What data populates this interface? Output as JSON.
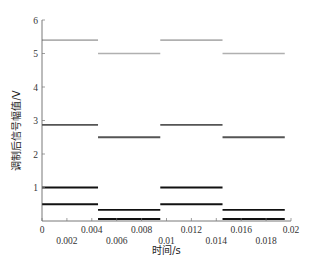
{
  "chart_data": {
    "type": "line",
    "title": "",
    "xlabel": "时间/s",
    "ylabel": "调制后信号幅值/V",
    "xlim": [
      0,
      0.02
    ],
    "ylim": [
      0,
      6
    ],
    "grid": false,
    "legend": null,
    "x_ticks": [
      0,
      0.002,
      0.004,
      0.006,
      0.008,
      0.01,
      0.012,
      0.014,
      0.016,
      0.018,
      0.02
    ],
    "x_tick_labels": [
      "0",
      "0.002",
      "0.004",
      "0.006",
      "0.008",
      "0.01",
      "0.012",
      "0.014",
      "0.016",
      "0.018",
      "0.02"
    ],
    "y_ticks": [
      1,
      2,
      3,
      4,
      5,
      6
    ],
    "y_tick_labels": [
      "1",
      "2",
      "3",
      "4",
      "5",
      "6"
    ],
    "series": [
      {
        "name": "signal-1",
        "color": "#b0b0b0",
        "width": 1.6,
        "segments": [
          {
            "x0": 0,
            "x1": 0.0045,
            "y": 5.4
          },
          {
            "x0": 0.0045,
            "x1": 0.0095,
            "y": 5.0
          },
          {
            "x0": 0.0095,
            "x1": 0.0145,
            "y": 5.4
          },
          {
            "x0": 0.0145,
            "x1": 0.0195,
            "y": 5.0
          }
        ]
      },
      {
        "name": "signal-2",
        "color": "#555555",
        "width": 1.8,
        "segments": [
          {
            "x0": 0,
            "x1": 0.0045,
            "y": 2.87
          },
          {
            "x0": 0.0045,
            "x1": 0.0095,
            "y": 2.5
          },
          {
            "x0": 0.0095,
            "x1": 0.0145,
            "y": 2.87
          },
          {
            "x0": 0.0145,
            "x1": 0.0195,
            "y": 2.5
          }
        ]
      },
      {
        "name": "signal-3",
        "color": "#111111",
        "width": 2.2,
        "segments": [
          {
            "x0": 0,
            "x1": 0.0045,
            "y": 1.0
          },
          {
            "x0": 0.0045,
            "x1": 0.0095,
            "y": 0.06
          },
          {
            "x0": 0.0095,
            "x1": 0.0145,
            "y": 1.0
          },
          {
            "x0": 0.0145,
            "x1": 0.0195,
            "y": 0.06
          }
        ]
      },
      {
        "name": "signal-4",
        "color": "#111111",
        "width": 1.8,
        "segments": [
          {
            "x0": 0,
            "x1": 0.0045,
            "y": 0.5
          },
          {
            "x0": 0.0045,
            "x1": 0.0095,
            "y": 0.33
          },
          {
            "x0": 0.0095,
            "x1": 0.0145,
            "y": 0.5
          },
          {
            "x0": 0.0145,
            "x1": 0.0195,
            "y": 0.33
          }
        ]
      }
    ]
  },
  "layout": {
    "plot": {
      "left": 42,
      "right": 291,
      "top": 20,
      "bottom": 221
    }
  }
}
